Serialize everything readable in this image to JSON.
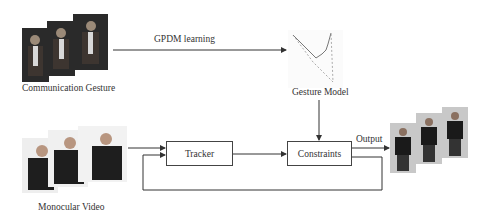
{
  "diagram": {
    "inputs": {
      "gesture": {
        "label": "Communication Gesture",
        "frame_count": 3
      },
      "video": {
        "label": "Monocular Video",
        "frame_count": 3
      }
    },
    "edges": {
      "learning": {
        "label": "GPDM learning"
      },
      "output": {
        "label": "Output"
      }
    },
    "model": {
      "label": "Gesture Model",
      "icon": "latent-trajectory-plot"
    },
    "boxes": {
      "tracker": {
        "label": "Tracker"
      },
      "constraints": {
        "label": "Constraints"
      }
    },
    "output_frames": {
      "frame_count": 3
    },
    "colors": {
      "line": "#333333",
      "box_border": "#444444",
      "gesture_frame_bg": "#2a2a2a",
      "video_frame_bg": "#eeeeee",
      "avatar_frame_bg": "#c8c8c8"
    }
  }
}
